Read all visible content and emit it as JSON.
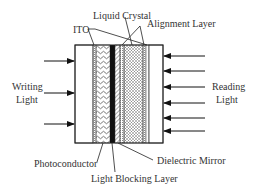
{
  "diagram": {
    "labels": {
      "ito": "ITO",
      "liquid_crystal": "Liquid Crystal",
      "alignment_layer": "Alignment Layer",
      "writing_light_1": "Writing",
      "writing_light_2": "Light",
      "reading_light_1": "Reading",
      "reading_light_2": "Light",
      "photoconductor": "Photoconductor",
      "light_blocking_layer": "Light Blocking Layer",
      "dielectric_mirror": "Dielectric Mirror"
    },
    "layers": [
      {
        "name": "glass-left",
        "x": 75,
        "w": 18
      },
      {
        "name": "ito-left",
        "x": 93,
        "w": 3
      },
      {
        "name": "photoconductor",
        "x": 96,
        "w": 14
      },
      {
        "name": "light-blocking-layer",
        "x": 110,
        "w": 5
      },
      {
        "name": "dielectric-mirror",
        "x": 115,
        "w": 5
      },
      {
        "name": "alignment-left",
        "x": 120,
        "w": 4
      },
      {
        "name": "liquid-crystal",
        "x": 124,
        "w": 19
      },
      {
        "name": "alignment-right",
        "x": 143,
        "w": 3
      },
      {
        "name": "ito-right",
        "x": 146,
        "w": 3
      },
      {
        "name": "glass-right",
        "x": 149,
        "w": 14
      }
    ],
    "writing_arrows_y": [
      61,
      93,
      124
    ],
    "reading_arrows_y": [
      56,
      71,
      87,
      103,
      118,
      131
    ]
  }
}
